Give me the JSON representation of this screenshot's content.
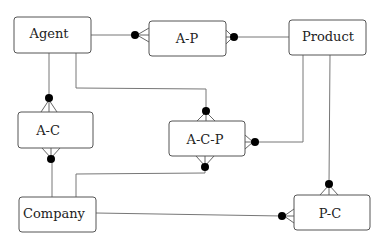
{
  "diagram": {
    "type": "entity-relationship",
    "notation": "crow's foot with filled circle (zero-or-many)",
    "entities": [
      {
        "id": "agent",
        "label": "Agent"
      },
      {
        "id": "ap",
        "label": "A-P"
      },
      {
        "id": "product",
        "label": "Product"
      },
      {
        "id": "ac",
        "label": "A-C"
      },
      {
        "id": "acp",
        "label": "A-C-P"
      },
      {
        "id": "company",
        "label": "Company"
      },
      {
        "id": "pc",
        "label": "P-C"
      }
    ],
    "relationships": [
      {
        "from": "agent",
        "to": "ap",
        "many_end": "ap"
      },
      {
        "from": "product",
        "to": "ap",
        "many_end": "ap"
      },
      {
        "from": "agent",
        "to": "ac",
        "many_end": "ac"
      },
      {
        "from": "company",
        "to": "ac",
        "many_end": "ac"
      },
      {
        "from": "agent",
        "to": "acp",
        "many_end": "acp"
      },
      {
        "from": "product",
        "to": "acp",
        "many_end": "acp"
      },
      {
        "from": "company",
        "to": "acp",
        "many_end": "acp"
      },
      {
        "from": "product",
        "to": "pc",
        "many_end": "pc"
      },
      {
        "from": "company",
        "to": "pc",
        "many_end": "pc"
      }
    ]
  }
}
